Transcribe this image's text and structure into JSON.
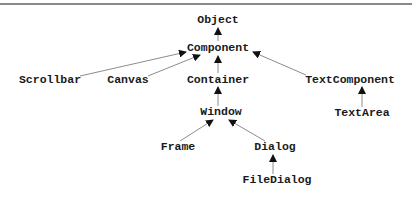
{
  "diagram": {
    "type": "class-hierarchy",
    "nodes": [
      {
        "id": "object",
        "label": "Object",
        "x": 218,
        "y": 20
      },
      {
        "id": "component",
        "label": "Component",
        "x": 218,
        "y": 48
      },
      {
        "id": "scrollbar",
        "label": "Scrollbar",
        "x": 50,
        "y": 80
      },
      {
        "id": "canvas",
        "label": "Canvas",
        "x": 128,
        "y": 80
      },
      {
        "id": "container",
        "label": "Container",
        "x": 218,
        "y": 80
      },
      {
        "id": "textcomponent",
        "label": "TextComponent",
        "x": 350,
        "y": 80
      },
      {
        "id": "window",
        "label": "Window",
        "x": 221,
        "y": 112
      },
      {
        "id": "textarea",
        "label": "TextArea",
        "x": 362,
        "y": 113
      },
      {
        "id": "frame",
        "label": "Frame",
        "x": 178,
        "y": 147
      },
      {
        "id": "dialog",
        "label": "Dialog",
        "x": 275,
        "y": 147
      },
      {
        "id": "filedialog",
        "label": "FileDialog",
        "x": 277,
        "y": 180
      }
    ],
    "edges": [
      {
        "from": "component",
        "to": "object"
      },
      {
        "from": "scrollbar",
        "to": "component"
      },
      {
        "from": "canvas",
        "to": "component"
      },
      {
        "from": "container",
        "to": "component"
      },
      {
        "from": "textcomponent",
        "to": "component"
      },
      {
        "from": "window",
        "to": "container"
      },
      {
        "from": "textarea",
        "to": "textcomponent"
      },
      {
        "from": "frame",
        "to": "window"
      },
      {
        "from": "dialog",
        "to": "window"
      },
      {
        "from": "filedialog",
        "to": "dialog"
      }
    ],
    "colors": {
      "text": "#1a1a1a",
      "edge": "#8c8c8c",
      "arrowhead": "#111111",
      "rule": "#8a8a8a"
    }
  }
}
